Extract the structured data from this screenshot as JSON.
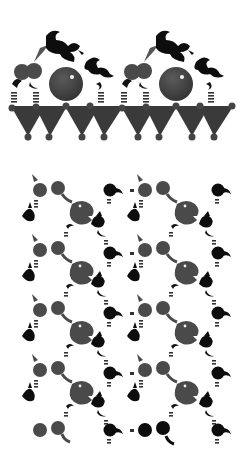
{
  "figure": {
    "colors": {
      "gray_atom": "#4a4a4a",
      "black_atom": "#0d0d0d",
      "substrate": "#3a3a3a",
      "background": "#ffffff",
      "highlight": "#f2f2f2"
    },
    "top_panel": {
      "units": [
        {
          "offset_x": 0
        },
        {
          "offset_x": 110
        }
      ],
      "substrate_nodes_x": [
        12,
        36,
        66,
        90,
        122,
        146,
        176,
        200,
        232
      ],
      "substrate_bottom_x": [
        28,
        49,
        82,
        104,
        138,
        158,
        192,
        214
      ]
    },
    "bottom_panel": {
      "columns_x": [
        40,
        110,
        145,
        215
      ],
      "rows_y": [
        0,
        60,
        120,
        180,
        240
      ]
    }
  }
}
